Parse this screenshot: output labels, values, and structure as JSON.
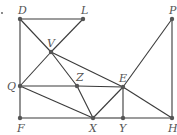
{
  "diagram": {
    "type": "geometry-figure",
    "stray_mark": {
      "x": 2,
      "y": 13
    },
    "points": [
      {
        "name": "D",
        "x": 20,
        "y": 19,
        "label_dx": -2,
        "label_dy": -5
      },
      {
        "name": "L",
        "x": 83,
        "y": 19,
        "label_dx": -2,
        "label_dy": -5
      },
      {
        "name": "P",
        "x": 172,
        "y": 19,
        "label_dx": -3,
        "label_dy": -5
      },
      {
        "name": "V",
        "x": 51,
        "y": 52,
        "label_dx": -4,
        "label_dy": -5
      },
      {
        "name": "Q",
        "x": 20,
        "y": 86,
        "label_dx": -13,
        "label_dy": 4
      },
      {
        "name": "Z",
        "x": 77,
        "y": 86,
        "label_dx": -1,
        "label_dy": -5
      },
      {
        "name": "E",
        "x": 123,
        "y": 87,
        "label_dx": -4,
        "label_dy": -5
      },
      {
        "name": "F",
        "x": 20,
        "y": 118,
        "label_dx": -3,
        "label_dy": 14
      },
      {
        "name": "X",
        "x": 93,
        "y": 118,
        "label_dx": -4,
        "label_dy": 14
      },
      {
        "name": "Y",
        "x": 123,
        "y": 118,
        "label_dx": -4,
        "label_dy": 14
      },
      {
        "name": "H",
        "x": 172,
        "y": 118,
        "label_dx": -4,
        "label_dy": 14
      }
    ],
    "segments": [
      [
        "D",
        "L"
      ],
      [
        "D",
        "F"
      ],
      [
        "L",
        "V"
      ],
      [
        "D",
        "V"
      ],
      [
        "V",
        "Z"
      ],
      [
        "Z",
        "X"
      ],
      [
        "V",
        "E"
      ],
      [
        "E",
        "H"
      ],
      [
        "V",
        "Q"
      ],
      [
        "Q",
        "Z"
      ],
      [
        "Z",
        "E"
      ],
      [
        "Q",
        "X"
      ],
      [
        "F",
        "X"
      ],
      [
        "X",
        "Y"
      ],
      [
        "Y",
        "H"
      ],
      [
        "X",
        "E"
      ],
      [
        "E",
        "Y"
      ],
      [
        "E",
        "P"
      ],
      [
        "P",
        "H"
      ]
    ]
  }
}
